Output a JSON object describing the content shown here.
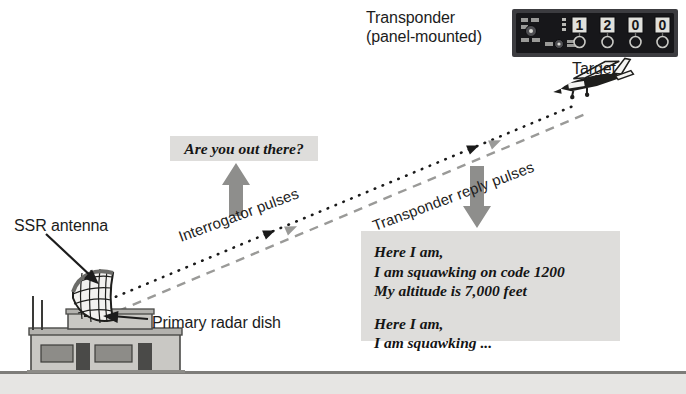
{
  "figure": {
    "type": "diagram",
    "background_color": "#ffffff"
  },
  "labels": {
    "transponder_line1": "Transponder",
    "transponder_line2": "(panel-mounted)",
    "target": "Target",
    "ssr_antenna": "SSR antenna",
    "primary_radar_dish": "Primary radar dish",
    "interrogator_pulses": "Interrogator pulses",
    "transponder_reply_pulses": "Transponder reply pulses"
  },
  "messages": {
    "question": "Are you out there?",
    "reply_block_1": [
      "Here I am,",
      "I am squawking on code 1200",
      "My altitude is 7,000 feet"
    ],
    "reply_block_2": [
      "Here I am,",
      "I am squawking ..."
    ]
  },
  "transponder_unit": {
    "code_digits": [
      "1",
      "2",
      "0",
      "0"
    ],
    "squawk_code": "1200",
    "body_color": "#17171a",
    "bezel_color": "#3c3c40",
    "digit_color": "#d8d8d4"
  },
  "colors": {
    "ink": "#1c1c1c",
    "message_box_fill": "#dedddb",
    "ground_band": "#e6e5e3",
    "ground_line": "#7d7c79",
    "interrogator_ray": "#1a1a1a",
    "reply_ray": "#9a9a98",
    "block_arrow": "#8e8e8c",
    "building_wall": "#c9c8c4",
    "building_shadow": "#a7a6a2",
    "window_fill": "#8d8c88",
    "door_fill": "#4a4a48"
  },
  "rays": {
    "interrogator": {
      "style": "dotted",
      "direction": "ground-to-aircraft",
      "color": "#1a1a1a"
    },
    "reply": {
      "style": "dashed",
      "direction": "aircraft-to-ground",
      "color": "#9a9a98"
    }
  },
  "altitude_text": "7,000 feet",
  "code_text": "1200"
}
